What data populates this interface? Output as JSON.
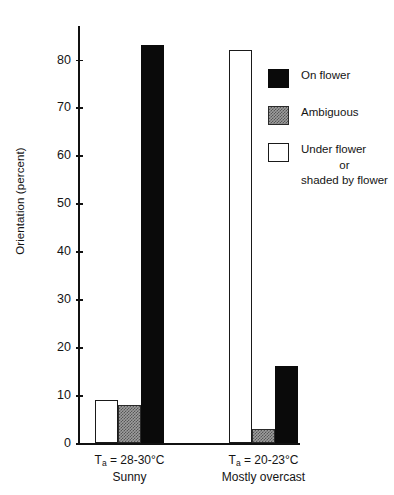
{
  "chart_data": {
    "type": "bar",
    "title": "",
    "xlabel": "",
    "ylabel": "Orientation (percent)",
    "ylim": [
      0,
      87
    ],
    "yticks": [
      0,
      10,
      20,
      30,
      40,
      50,
      60,
      70,
      80
    ],
    "ytick_labels": [
      "0",
      "10",
      "20",
      "30",
      "40",
      "50",
      "60",
      "70",
      "80"
    ],
    "grid": false,
    "legend_position": "right",
    "categories": [
      {
        "line1_prefix": "T",
        "line1_sub": "a",
        "line1_rest": " = 28-30°C",
        "line2": "Sunny"
      },
      {
        "line1_prefix": "T",
        "line1_sub": "a",
        "line1_rest": " = 20-23°C",
        "line2": "Mostly overcast"
      }
    ],
    "series": [
      {
        "name": "Under flower or shaded by flower",
        "style": "white",
        "values": [
          9,
          82
        ]
      },
      {
        "name": "Ambiguous",
        "style": "gray",
        "values": [
          8,
          3
        ]
      },
      {
        "name": "On flower",
        "style": "black",
        "values": [
          83,
          16
        ]
      }
    ],
    "legend": [
      {
        "swatch": "black",
        "lines": [
          "On flower"
        ]
      },
      {
        "swatch": "gray",
        "lines": [
          "Ambiguous"
        ]
      },
      {
        "swatch": "white",
        "lines": [
          "Under flower",
          "or",
          "shaded by flower"
        ]
      }
    ],
    "colors": {
      "black": "#0a0a0a",
      "gray": "#9d9d9d",
      "white": "#ffffff",
      "axis": "#111111",
      "text": "#141414"
    }
  }
}
